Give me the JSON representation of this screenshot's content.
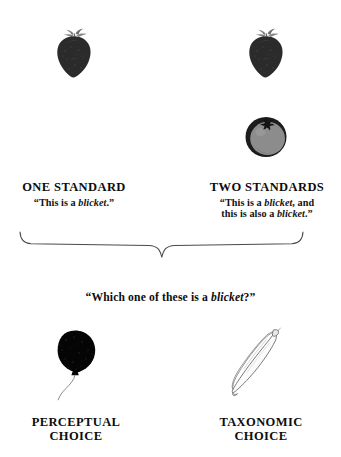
{
  "figure": {
    "background_color": "#ffffff",
    "ink_color": "#111111"
  },
  "conditions": [
    {
      "id": "one-standard",
      "label": "ONE STANDARD",
      "utterance_plain": "“This is a blicket.”",
      "utterance_parts": [
        "“This is a ",
        "blicket",
        ".”"
      ],
      "stimuli": [
        {
          "name": "strawberry",
          "icon": "strawberry-icon",
          "fill": "#2b2b2b"
        }
      ]
    },
    {
      "id": "two-standards",
      "label": "TWO STANDARDS",
      "utterance_line1_parts": [
        "“This is a ",
        "blicket",
        ", and"
      ],
      "utterance_line2_parts": [
        "this is also a ",
        "blicket",
        ".”"
      ],
      "stimuli": [
        {
          "name": "strawberry",
          "icon": "strawberry-icon",
          "fill": "#2b2b2b"
        },
        {
          "name": "tomato",
          "icon": "tomato-icon",
          "fill": "#8c8c8c",
          "outline": "#1c1c1c"
        }
      ]
    }
  ],
  "brace": {
    "name": "curly-brace",
    "orientation": "down",
    "stroke_color": "#4a4a4a"
  },
  "question": {
    "parts": [
      "“Which one of these is a ",
      "blicket",
      "?”"
    ],
    "plain": "“Which one of these is a blicket?”"
  },
  "choices": [
    {
      "id": "perceptual",
      "label_line1": "PERCEPTUAL",
      "label_line2": "CHOICE",
      "stimulus": {
        "name": "balloon",
        "icon": "balloon-icon",
        "fill": "#050505"
      }
    },
    {
      "id": "taxonomic",
      "label_line1": "TAXONOMIC",
      "label_line2": "CHOICE",
      "stimulus": {
        "name": "banana",
        "icon": "banana-icon",
        "fill": "#fbfbfb",
        "outline": "#5d5d5d"
      }
    }
  ]
}
